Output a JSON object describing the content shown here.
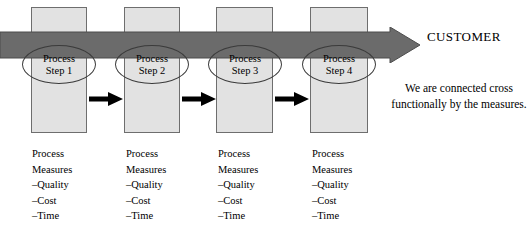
{
  "diagram": {
    "customer_label": "CUSTOMER",
    "note": "We are connected cross functionally by the measures.",
    "colors": {
      "column_fill": "#e2e2e2",
      "column_stroke": "#6e6e6e",
      "customer_arrow_fill": "#6b6b6b",
      "customer_arrow_stroke": "#4d4d4d",
      "flow_arrow_fill": "#000000",
      "ellipse_stroke": "#3b3b3b",
      "background": "#ffffff"
    },
    "columns": [
      {
        "step_line1": "Process",
        "step_line2": "Step 1",
        "measures_title_line1": "Process",
        "measures_title_line2": "Measures",
        "measures": [
          "–Quality",
          "–Cost",
          "–Time"
        ]
      },
      {
        "step_line1": "Process",
        "step_line2": "Step 2",
        "measures_title_line1": "Process",
        "measures_title_line2": "Measures",
        "measures": [
          "–Quality",
          "–Cost",
          "–Time"
        ]
      },
      {
        "step_line1": "Process",
        "step_line2": "Step 3",
        "measures_title_line1": "Process",
        "measures_title_line2": "Measures",
        "measures": [
          "–Quality",
          "–Cost",
          "–Time"
        ]
      },
      {
        "step_line1": "Process",
        "step_line2": "Step 4",
        "measures_title_line1": "Process",
        "measures_title_line2": "Measures",
        "measures": [
          "–Quality",
          "–Cost",
          "–Time"
        ]
      }
    ]
  }
}
